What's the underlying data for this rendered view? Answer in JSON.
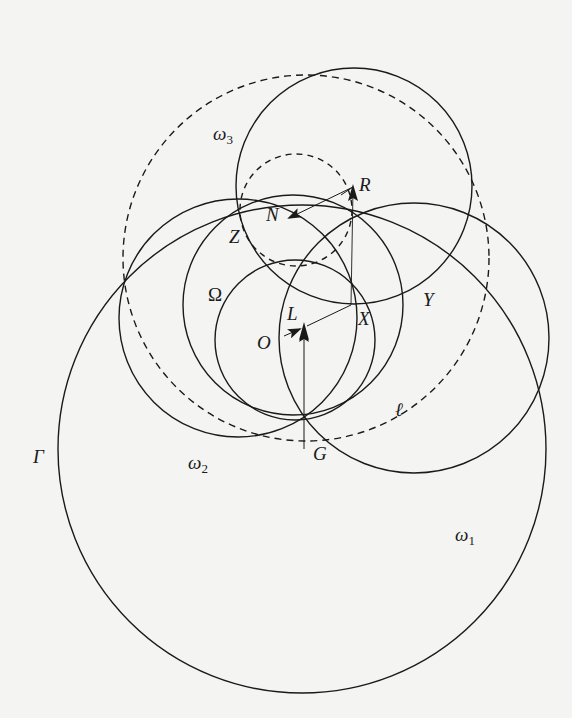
{
  "figure": {
    "background": "#f4f4f2",
    "stroke_color": "#1a1a1a",
    "circles": [
      {
        "id": "Gamma",
        "label": "Γ",
        "cx": 302,
        "cy": 449,
        "r": 244,
        "style": "solid"
      },
      {
        "id": "omega1",
        "label": "ω",
        "subscript": "1",
        "cx": 414,
        "cy": 338,
        "r": 135,
        "style": "solid"
      },
      {
        "id": "omega2",
        "label": "ω",
        "subscript": "2",
        "cx": 238,
        "cy": 318,
        "r": 119,
        "style": "solid"
      },
      {
        "id": "omega3",
        "label": "ω",
        "subscript": "3",
        "cx": 354,
        "cy": 186,
        "r": 118,
        "style": "solid"
      },
      {
        "id": "Omega",
        "label": "Ω",
        "cx": 293,
        "cy": 305,
        "r": 110,
        "style": "solid"
      },
      {
        "id": "incircle-O",
        "cx": 295,
        "cy": 340,
        "r": 80,
        "style": "solid"
      },
      {
        "id": "dashed-large",
        "cx": 306,
        "cy": 258,
        "r": 183,
        "style": "dashed"
      },
      {
        "id": "dashed-small",
        "cx": 296,
        "cy": 210,
        "r": 56,
        "style": "dashed"
      }
    ],
    "points": [
      {
        "name": "R",
        "x": 353,
        "y": 187
      },
      {
        "name": "N",
        "x": 289,
        "y": 218
      },
      {
        "name": "Z",
        "x": 241,
        "y": 215
      },
      {
        "name": "X",
        "x": 351,
        "y": 305
      },
      {
        "name": "Y",
        "x": 415,
        "y": 287
      },
      {
        "name": "L",
        "x": 304,
        "y": 327
      },
      {
        "name": "O",
        "x": 284,
        "y": 339
      },
      {
        "name": "G",
        "x": 304,
        "y": 449
      }
    ],
    "labels": [
      {
        "text": "ω",
        "sub": "3",
        "x": 213,
        "y": 140
      },
      {
        "text": "R",
        "x": 359,
        "y": 191
      },
      {
        "text": "N",
        "x": 266,
        "y": 221
      },
      {
        "text": "Z",
        "x": 229,
        "y": 243
      },
      {
        "text": "Ω",
        "x": 208,
        "y": 301,
        "upright": true
      },
      {
        "text": "Y",
        "x": 423,
        "y": 306
      },
      {
        "text": "X",
        "x": 358,
        "y": 325
      },
      {
        "text": "L",
        "x": 287,
        "y": 320
      },
      {
        "text": "O",
        "x": 257,
        "y": 349
      },
      {
        "text": "ℓ",
        "x": 395,
        "y": 416
      },
      {
        "text": "Γ",
        "x": 33,
        "y": 463
      },
      {
        "text": "G",
        "x": 313,
        "y": 460
      },
      {
        "text": "ω",
        "sub": "2",
        "x": 188,
        "y": 469
      },
      {
        "text": "ω",
        "sub": "1",
        "x": 455,
        "y": 541
      }
    ],
    "segments": [
      {
        "from": "R",
        "to": "X",
        "thin": true
      },
      {
        "from": "X",
        "to": "L"
      },
      {
        "from": "G",
        "to": "L",
        "arrow": true
      },
      {
        "from": "R",
        "to": "N",
        "arrow": true
      }
    ]
  }
}
